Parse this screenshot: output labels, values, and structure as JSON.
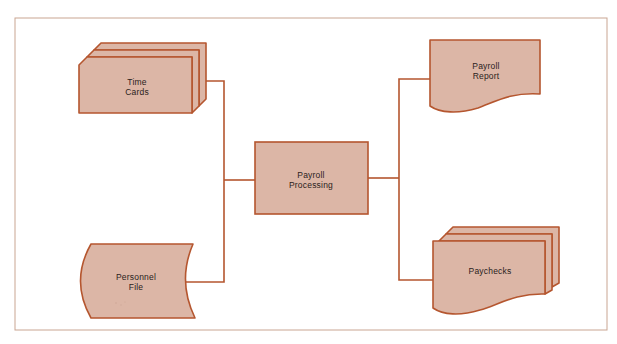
{
  "diagram": {
    "type": "system-flowchart",
    "colors": {
      "frame": "#c9a592",
      "stroke": "#b5562f",
      "fill": "#dcb6a6",
      "text": "#2a2220"
    },
    "nodes": [
      {
        "id": "time-cards",
        "shape": "punched-card-stack",
        "line1": "Time",
        "line2": "Cards"
      },
      {
        "id": "personnel-file",
        "shape": "stored-data",
        "line1": "Personnel",
        "line2": "File"
      },
      {
        "id": "payroll-processing",
        "shape": "process",
        "line1": "Payroll",
        "line2": "Processing"
      },
      {
        "id": "payroll-report",
        "shape": "document",
        "line1": "Payroll",
        "line2": "Report"
      },
      {
        "id": "paychecks",
        "shape": "multi-document",
        "line1": "Paychecks"
      }
    ],
    "edges": [
      {
        "from": "time-cards",
        "to": "payroll-processing"
      },
      {
        "from": "personnel-file",
        "to": "payroll-processing"
      },
      {
        "from": "payroll-processing",
        "to": "payroll-report"
      },
      {
        "from": "payroll-processing",
        "to": "paychecks"
      }
    ]
  }
}
